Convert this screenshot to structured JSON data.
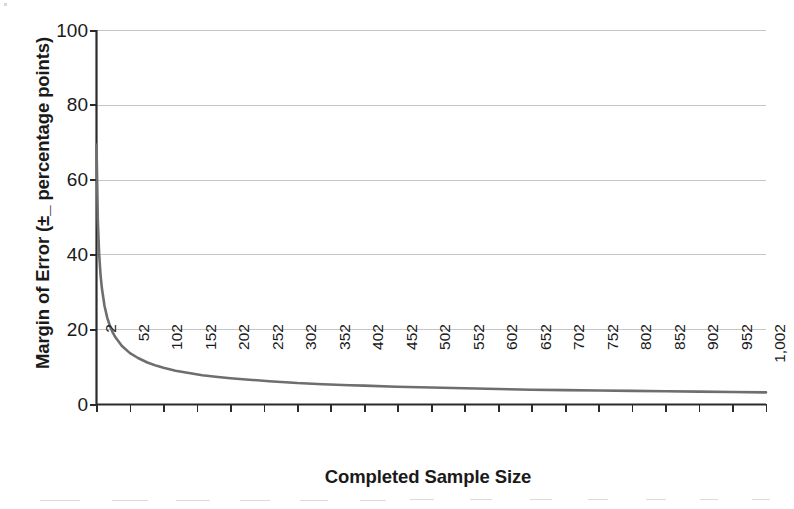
{
  "chart_data": {
    "type": "line",
    "title": "",
    "xlabel": "Completed Sample Size",
    "ylabel": "Margin of Error (±_ percentage points)",
    "xlim": [
      2,
      1002
    ],
    "ylim": [
      0,
      100
    ],
    "grid": true,
    "legend": "none",
    "series_color": "#6e6e6e",
    "x_tick_labels": [
      "2",
      "52",
      "102",
      "152",
      "202",
      "252",
      "302",
      "352",
      "402",
      "452",
      "502",
      "552",
      "602",
      "652",
      "702",
      "752",
      "802",
      "852",
      "902",
      "952",
      "1,002"
    ],
    "x_tick_values": [
      2,
      52,
      102,
      152,
      202,
      252,
      302,
      352,
      402,
      452,
      502,
      552,
      602,
      652,
      702,
      752,
      802,
      852,
      902,
      952,
      1002
    ],
    "y_tick_labels": [
      "0",
      "20",
      "40",
      "60",
      "80",
      "100"
    ],
    "y_tick_values": [
      0,
      20,
      40,
      60,
      80,
      100
    ],
    "series": [
      {
        "name": "Margin of Error",
        "formula": "98 / sqrt(n)",
        "x": [
          2,
          4,
          6,
          8,
          10,
          14,
          18,
          22,
          26,
          30,
          40,
          52,
          64,
          78,
          92,
          102,
          120,
          140,
          160,
          180,
          202,
          230,
          260,
          302,
          340,
          380,
          402,
          450,
          502,
          552,
          602,
          652,
          702,
          752,
          802,
          852,
          902,
          952,
          1002
        ],
        "y": [
          69.3,
          49.0,
          40.0,
          34.6,
          31.0,
          26.2,
          23.1,
          20.9,
          19.2,
          17.9,
          15.5,
          13.6,
          12.3,
          11.1,
          10.2,
          9.7,
          8.9,
          8.3,
          7.7,
          7.3,
          6.9,
          6.5,
          6.1,
          5.6,
          5.3,
          5.0,
          4.9,
          4.6,
          4.4,
          4.2,
          4.0,
          3.8,
          3.7,
          3.6,
          3.5,
          3.4,
          3.3,
          3.2,
          3.1
        ]
      }
    ]
  },
  "axes": {
    "y_title": "Margin of Error (±_ percentage points)",
    "x_title": "Completed Sample Size"
  }
}
